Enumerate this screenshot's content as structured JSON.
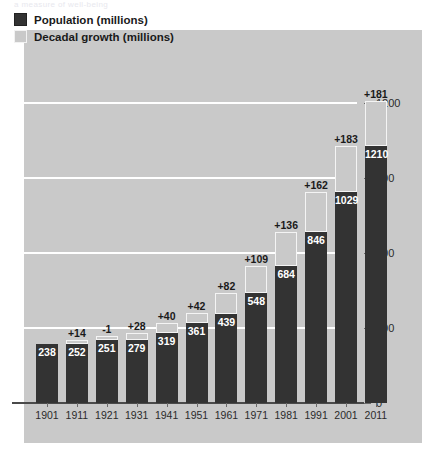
{
  "cut_text": "a measure of well-being",
  "legend": {
    "items": [
      {
        "label": "Population (millions)",
        "swatch": "dark"
      },
      {
        "label": "Decadal growth (millions)",
        "swatch": "light"
      }
    ]
  },
  "colors": {
    "panel_background": "#c9c9c9",
    "population_bar": "#333333",
    "growth_bar_fill": "#c9c9c9",
    "growth_bar_border": "#f4f4f4",
    "gridline": "#ffffff",
    "axis": "#4a4a4a",
    "label_text": "#1a1a1a"
  },
  "chart_data": {
    "type": "bar",
    "title": "",
    "subtitle": "",
    "xlabel": "",
    "ylabel": "",
    "ylim": [
      0,
      1290
    ],
    "yticks": [
      0,
      300,
      600,
      900,
      1200
    ],
    "ytick_labels": [
      "0",
      "300",
      "600",
      "900",
      "1200"
    ],
    "grid": true,
    "gridlines_at": [
      300,
      600,
      900,
      1200
    ],
    "legend_position": "top-left",
    "categories": [
      "1901",
      "1911",
      "1921",
      "1931",
      "1941",
      "1951",
      "1961",
      "1971",
      "1981",
      "1991",
      "2001",
      "2011"
    ],
    "series": [
      {
        "name": "Population (millions)",
        "values": [
          238,
          252,
          251,
          279,
          319,
          361,
          439,
          548,
          684,
          846,
          1029,
          1210
        ],
        "labels": [
          "238",
          "252",
          "251",
          "279",
          "319",
          "361",
          "439",
          "548",
          "684",
          "846",
          "1029",
          "1210"
        ]
      },
      {
        "name": "Decadal growth (millions)",
        "values": [
          null,
          14,
          -1,
          28,
          40,
          42,
          82,
          109,
          136,
          162,
          183,
          181
        ],
        "labels": [
          "",
          "+14",
          "-1",
          "+28",
          "+40",
          "+42",
          "+82",
          "+109",
          "+136",
          "+162",
          "+183",
          "+181"
        ]
      }
    ]
  }
}
